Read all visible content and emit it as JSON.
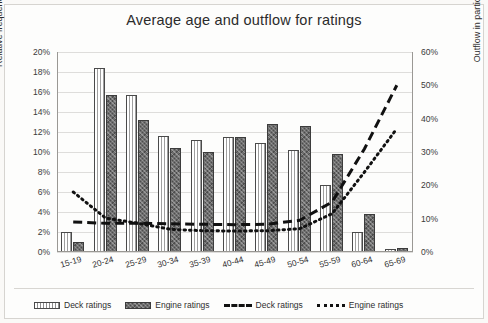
{
  "chart_data": {
    "type": "bar",
    "title": "Average age and outflow for ratings",
    "xlabel": "",
    "ylabel": "Relative frequency of age",
    "y2label": "Outflow in particular age group",
    "categories": [
      "15-19",
      "20-24",
      "25-29",
      "30-34",
      "35-39",
      "40-44",
      "45-49",
      "50-54",
      "55-59",
      "60-64",
      "65-69"
    ],
    "ylim": [
      0,
      20
    ],
    "y2lim": [
      0,
      60
    ],
    "ytick_labels": [
      "0%",
      "2%",
      "4%",
      "6%",
      "8%",
      "10%",
      "12%",
      "14%",
      "16%",
      "18%",
      "20%"
    ],
    "y2tick_labels": [
      "0%",
      "10%",
      "20%",
      "30%",
      "40%",
      "50%",
      "60%"
    ],
    "grid": true,
    "legend_position": "bottom",
    "series": [
      {
        "name": "Deck ratings",
        "kind": "bar",
        "axis": "left",
        "values": [
          2.0,
          18.4,
          15.7,
          11.6,
          11.2,
          11.5,
          10.9,
          10.2,
          6.7,
          2.0,
          0.3
        ]
      },
      {
        "name": "Engine ratings",
        "kind": "bar",
        "axis": "left",
        "values": [
          1.0,
          15.7,
          13.2,
          10.4,
          10.0,
          11.5,
          12.8,
          12.6,
          9.8,
          3.8,
          0.4
        ]
      },
      {
        "name": "Deck ratings",
        "kind": "line-dashed",
        "axis": "right",
        "values": [
          9.0,
          8.6,
          8.6,
          8.5,
          8.3,
          8.2,
          8.3,
          9.5,
          15.0,
          31.0,
          50.0
        ]
      },
      {
        "name": "Engine ratings",
        "kind": "line-dotted",
        "axis": "right",
        "values": [
          18.0,
          10.2,
          8.6,
          6.8,
          6.4,
          6.3,
          6.4,
          7.0,
          11.5,
          24.0,
          37.0
        ]
      }
    ]
  },
  "legend": {
    "items": [
      {
        "label": "Deck ratings",
        "marker": "bar-light"
      },
      {
        "label": "Engine ratings",
        "marker": "bar-dark"
      },
      {
        "label": "Deck ratings",
        "marker": "line-dashed"
      },
      {
        "label": "Engine ratings",
        "marker": "line-dotted"
      }
    ]
  }
}
